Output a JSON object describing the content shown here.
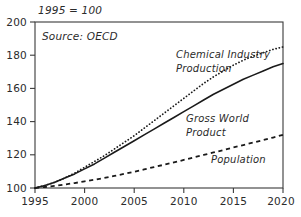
{
  "chart_data": {
    "type": "line",
    "title": "",
    "note": "1995 = 100",
    "source": "Source: OECD",
    "xlabel": "",
    "ylabel": "",
    "xlim": [
      1995,
      2020
    ],
    "ylim": [
      100,
      200
    ],
    "grid": false,
    "legend_position": "inline-annotations",
    "xticks": [
      "1995",
      "2000",
      "2005",
      "2010",
      "2015",
      "2020"
    ],
    "xtick_values": [
      1995,
      2000,
      2005,
      2010,
      2015,
      2020
    ],
    "yticks": [
      "100",
      "120",
      "140",
      "160",
      "180",
      "200"
    ],
    "ytick_values": [
      100,
      120,
      140,
      160,
      180,
      200
    ],
    "x": [
      1995,
      1996,
      1997,
      1998,
      1999,
      2000,
      2001,
      2002,
      2003,
      2004,
      2005,
      2006,
      2007,
      2008,
      2009,
      2010,
      2011,
      2012,
      2013,
      2014,
      2015,
      2016,
      2017,
      2018,
      2019,
      2020
    ],
    "series": [
      {
        "name": "Chemical Industry Production",
        "style": "dotted",
        "values": [
          100,
          101.5,
          103.5,
          106,
          109,
          112.5,
          116,
          119.5,
          123.5,
          127.5,
          131.5,
          136,
          140.5,
          145,
          149.5,
          154,
          158.5,
          163,
          167,
          170.5,
          174,
          177,
          179.5,
          181.5,
          183.5,
          185
        ]
      },
      {
        "name": "Gross World Product",
        "style": "solid",
        "values": [
          100,
          101.5,
          103.5,
          106,
          108.5,
          111.5,
          114.5,
          118,
          121.5,
          125,
          128.5,
          132,
          135.5,
          139,
          142.5,
          146,
          149.5,
          153,
          156.5,
          159.5,
          162.5,
          165.5,
          168,
          170.5,
          173,
          175
        ]
      },
      {
        "name": "Population",
        "style": "dashed",
        "values": [
          100,
          100.6,
          101.3,
          102.1,
          103,
          104,
          105,
          106.1,
          107.3,
          108.5,
          109.8,
          111.2,
          112.6,
          114,
          115.4,
          116.9,
          118.4,
          119.9,
          121.4,
          122.9,
          124.4,
          125.9,
          127.4,
          128.9,
          130.4,
          132
        ]
      }
    ],
    "annotations": [
      {
        "text_line1": "Chemical Industry",
        "text_line2": "Production"
      },
      {
        "text_line1": "Gross World",
        "text_line2": "Product"
      },
      {
        "text_line1": "Population",
        "text_line2": ""
      }
    ],
    "colors": {
      "line": "#1a1a1a",
      "axis": "#3a3a3a",
      "text": "#2b2b2b",
      "background": "#ffffff"
    }
  },
  "labels": {
    "note": "1995 = 100",
    "source": "Source: OECD",
    "chem_line1": "Chemical Industry",
    "chem_line2": "Production",
    "gwp_line1": "Gross World",
    "gwp_line2": "Product",
    "pop_line1": "Population",
    "y0": "100",
    "y1": "120",
    "y2": "140",
    "y3": "160",
    "y4": "180",
    "y5": "200",
    "x0": "1995",
    "x1": "2000",
    "x2": "2005",
    "x3": "2010",
    "x4": "2015",
    "x5": "2020"
  }
}
